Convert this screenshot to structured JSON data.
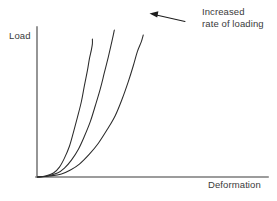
{
  "chart_data": {
    "type": "line",
    "title": "",
    "xlabel": "Deformation",
    "ylabel": "Load",
    "grid": false,
    "legend_position": "none",
    "axis_ticks": [],
    "annotations": [
      {
        "name": "increased-rate-of-loading",
        "line1": "Increased",
        "line2": "rate of loading",
        "arrow": "points left toward the curves, indicating curves shift left as loading rate increases"
      }
    ],
    "series": [
      {
        "name": "lowest rate of loading",
        "note": "rightmost curve, most compliant",
        "points": [
          [
            0,
            0
          ],
          [
            12,
            1
          ],
          [
            24,
            3
          ],
          [
            33,
            7
          ],
          [
            42,
            13
          ],
          [
            52,
            23
          ],
          [
            61,
            34
          ],
          [
            70,
            48
          ],
          [
            78,
            62
          ],
          [
            85,
            79
          ],
          [
            91,
            96
          ],
          [
            96,
            112
          ],
          [
            100,
            126
          ],
          [
            104,
            136
          ],
          [
            106,
            143
          ]
        ]
      },
      {
        "name": "intermediate rate of loading",
        "note": "middle curve",
        "points": [
          [
            0,
            0
          ],
          [
            10,
            1
          ],
          [
            20,
            4
          ],
          [
            27,
            9
          ],
          [
            34,
            17
          ],
          [
            41,
            28
          ],
          [
            47,
            41
          ],
          [
            53,
            56
          ],
          [
            58,
            72
          ],
          [
            63,
            89
          ],
          [
            67,
            105
          ],
          [
            71,
            121
          ],
          [
            74,
            134
          ],
          [
            76,
            143
          ],
          [
            77,
            148
          ]
        ]
      },
      {
        "name": "highest rate of loading",
        "note": "leftmost curve, stiffest response",
        "points": [
          [
            0,
            0
          ],
          [
            8,
            1
          ],
          [
            16,
            4
          ],
          [
            22,
            10
          ],
          [
            27,
            19
          ],
          [
            32,
            31
          ],
          [
            36,
            45
          ],
          [
            40,
            60
          ],
          [
            44,
            76
          ],
          [
            47,
            92
          ],
          [
            50,
            107
          ],
          [
            52,
            119
          ],
          [
            54,
            128
          ],
          [
            55,
            134
          ],
          [
            55,
            139
          ]
        ]
      }
    ],
    "xlim": [
      0,
      231
    ],
    "ylim": [
      0,
      151
    ]
  },
  "colors": {
    "curve": "#2b2b2b",
    "axis": "#7b7b7b",
    "text": "#3a3a3a",
    "arrow": "#1d1d1d",
    "background": "#ffffff"
  }
}
